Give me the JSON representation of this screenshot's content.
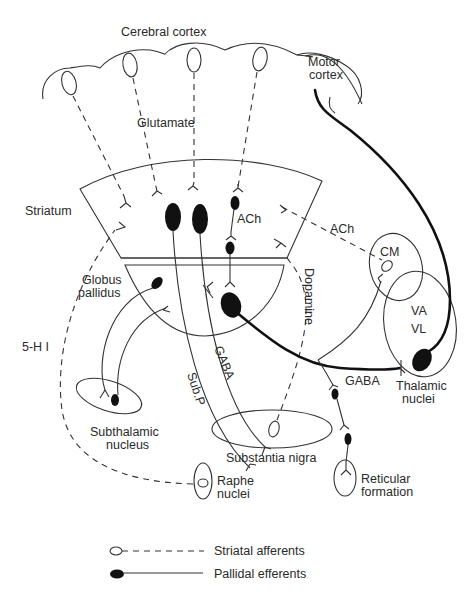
{
  "diagram": {
    "type": "neuroanatomy-pathway-diagram",
    "labels": {
      "cerebral_cortex": "Cerebral cortex",
      "motor_cortex_line1": "Motor",
      "motor_cortex_line2": "cortex",
      "glutamate": "Glutamate",
      "striatum": "Striatum",
      "ach_striatum": "ACh",
      "ach_cm": "ACh",
      "cm": "CM",
      "globus_pallidus_line1": "Globus",
      "globus_pallidus_line2": "pallidus",
      "dopamine": "Dopamine",
      "five_ht": "5-H I",
      "va": "VA",
      "vl": "VL",
      "sub_p": "Sub.P",
      "gaba_striatonigral": "GABA",
      "gaba_thalamic": "GABA",
      "thalamic_nuclei_line1": "Thalamic",
      "thalamic_nuclei_line2": "nuclei",
      "subthalamic_line1": "Subthalamic",
      "subthalamic_line2": "nucleus",
      "substantia_nigra": "Substantia nigra",
      "raphe_line1": "Raphe",
      "raphe_line2": "nuclei",
      "reticular_line1": "Reticular",
      "reticular_line2": "formation"
    },
    "structures": [
      "Cerebral cortex",
      "Motor cortex",
      "Striatum",
      "Globus pallidus",
      "CM",
      "VA/VL (Thalamic nuclei)",
      "Subthalamic nucleus",
      "Substantia nigra",
      "Raphe nuclei",
      "Reticular formation"
    ],
    "connections": [
      {
        "from": "Cerebral cortex",
        "to": "Striatum",
        "transmitter": "Glutamate",
        "style": "dashed"
      },
      {
        "from": "CM",
        "to": "Striatum",
        "transmitter": "ACh",
        "style": "dashed"
      },
      {
        "from": "Substantia nigra",
        "to": "Striatum",
        "transmitter": "Dopamine",
        "style": "dashed"
      },
      {
        "from": "Raphe nuclei",
        "to": "Striatum",
        "transmitter": "5-HT",
        "style": "dashed"
      },
      {
        "from": "Striatum",
        "to": "Substantia nigra",
        "transmitter": "Sub.P",
        "style": "solid"
      },
      {
        "from": "Striatum",
        "to": "Substantia nigra",
        "transmitter": "GABA",
        "style": "solid"
      },
      {
        "from": "Globus pallidus",
        "to": "Thalamic nuclei",
        "transmitter": "GABA",
        "style": "thick"
      },
      {
        "from": "Globus pallidus",
        "to": "Subthalamic nucleus",
        "style": "solid"
      },
      {
        "from": "Motor cortex",
        "to": "Thalamic nuclei",
        "style": "thick"
      },
      {
        "from": "Globus pallidus",
        "to": "Reticular formation",
        "style": "solid"
      }
    ]
  },
  "legend": {
    "items": [
      {
        "symbol": "open-ellipse-dashed-line",
        "label": "Striatal afferents"
      },
      {
        "symbol": "filled-ellipse-solid-line",
        "label": "Pallidal efferents"
      }
    ]
  }
}
